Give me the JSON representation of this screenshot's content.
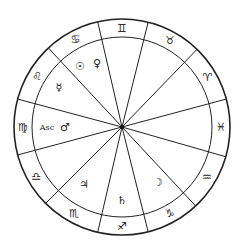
{
  "chart": {
    "center": [
      122,
      127
    ],
    "outer_radius": 108,
    "inner_radius": 90,
    "line_color": "#222222",
    "background": "#ffffff",
    "spoke_angles_deg": [
      103,
      76,
      46,
      15,
      -16,
      -47,
      -76,
      -103,
      -135,
      -165,
      165,
      133
    ],
    "signs": [
      {
        "name": "gemini",
        "glyph": "♊",
        "angle": 90
      },
      {
        "name": "taurus",
        "glyph": "♉",
        "angle": 61
      },
      {
        "name": "aries",
        "glyph": "♈",
        "angle": 30
      },
      {
        "name": "pisces",
        "glyph": "♓",
        "angle": 0
      },
      {
        "name": "aquarius",
        "glyph": "♒",
        "angle": -31
      },
      {
        "name": "capricorn",
        "glyph": "♑",
        "angle": -61
      },
      {
        "name": "sagittarius",
        "glyph": "♐",
        "angle": -90
      },
      {
        "name": "scorpio",
        "glyph": "♏",
        "angle": -119
      },
      {
        "name": "libra",
        "glyph": "♎",
        "angle": -150
      },
      {
        "name": "virgo",
        "glyph": "♍",
        "angle": 180
      },
      {
        "name": "leo",
        "glyph": "♌",
        "angle": 149
      },
      {
        "name": "cancer",
        "glyph": "♋",
        "angle": 118
      }
    ],
    "planets": [
      {
        "name": "sun",
        "glyph": "☉",
        "x": 80,
        "y": 66
      },
      {
        "name": "venus",
        "glyph": "♀",
        "x": 97,
        "y": 63
      },
      {
        "name": "mercury",
        "glyph": "☿",
        "x": 59,
        "y": 87
      },
      {
        "name": "ascendant",
        "glyph": "Asc",
        "x": 47,
        "y": 127
      },
      {
        "name": "mars",
        "glyph": "♂",
        "x": 65,
        "y": 127
      },
      {
        "name": "jupiter",
        "glyph": "♃",
        "x": 84,
        "y": 184
      },
      {
        "name": "saturn",
        "glyph": "♄",
        "x": 122,
        "y": 200
      },
      {
        "name": "moon",
        "glyph": "☽",
        "x": 158,
        "y": 182
      }
    ]
  }
}
